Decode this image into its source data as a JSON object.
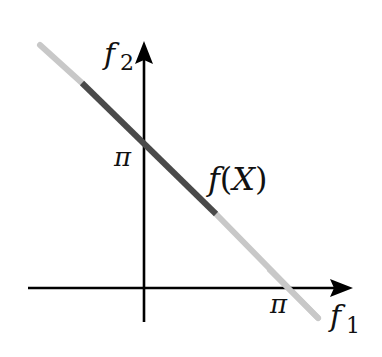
{
  "diagram": {
    "type": "pareto-front-sketch",
    "axes": {
      "x": {
        "label": "f",
        "subscript": "1",
        "tick_label": "π"
      },
      "y": {
        "label": "f",
        "subscript": "2",
        "tick_label": "π"
      }
    },
    "curve": {
      "label": "f(X)",
      "label_f": "f",
      "label_open": "(",
      "label_X": "X",
      "label_close": ")",
      "segments": [
        {
          "style": "light",
          "color": "#c8c8c8"
        },
        {
          "style": "dark",
          "color": "#4a4a4a"
        },
        {
          "style": "light",
          "color": "#c8c8c8"
        }
      ]
    },
    "colors": {
      "axis": "#000000",
      "background": "#ffffff",
      "highlight": "#4a4a4a",
      "faded": "#c8c8c8"
    }
  }
}
